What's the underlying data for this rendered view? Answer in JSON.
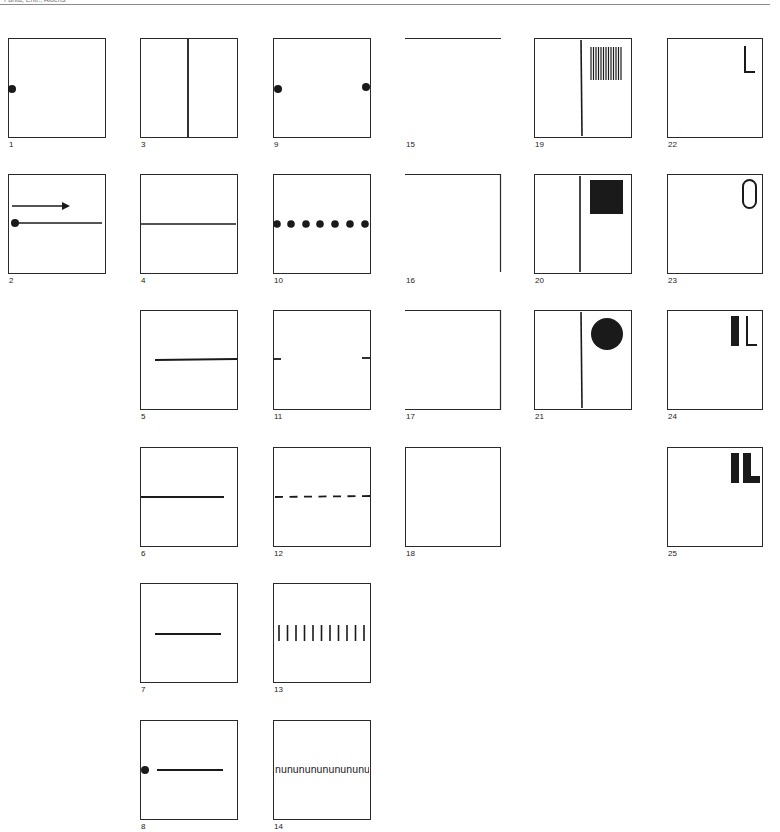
{
  "header": {
    "left_text": "Fanta, Entr., Alberts",
    "center_text": "",
    "right_text": ""
  },
  "figure": {
    "stroke_color": "#1a1a1a",
    "frame_color": "#2a2a2a",
    "panels": [
      {
        "id": "1",
        "label": "1",
        "description": "square frame with dot on left edge at mid-height"
      },
      {
        "id": "2",
        "label": "2",
        "description": "right-pointing arrow above a line starting from a dot at left edge"
      },
      {
        "id": "3",
        "label": "3",
        "description": "square frame divided by vertical center line"
      },
      {
        "id": "4",
        "label": "4",
        "description": "full-width horizontal line at mid-height"
      },
      {
        "id": "5",
        "label": "5",
        "description": "horizontal line from inner left to right edge"
      },
      {
        "id": "6",
        "label": "6",
        "description": "horizontal line from left edge to inner right"
      },
      {
        "id": "7",
        "label": "7",
        "description": "short centered horizontal line"
      },
      {
        "id": "8",
        "label": "8",
        "description": "dot on left edge followed by a detached horizontal line"
      },
      {
        "id": "9",
        "label": "9",
        "description": "dots on left and right edges"
      },
      {
        "id": "10",
        "label": "10",
        "description": "row of seven dots across mid-height"
      },
      {
        "id": "11",
        "label": "11",
        "description": "short ticks at left and right edges"
      },
      {
        "id": "12",
        "label": "12",
        "description": "dashed horizontal line of seven dashes"
      },
      {
        "id": "13",
        "label": "13",
        "description": "row of eleven short vertical bars"
      },
      {
        "id": "14",
        "label": "14",
        "description": "text string across mid-height",
        "text": "nunununununununu"
      },
      {
        "id": "15",
        "label": "15",
        "description": "top edge only"
      },
      {
        "id": "16",
        "label": "16",
        "description": "top and right edges only"
      },
      {
        "id": "17",
        "label": "17",
        "description": "top, right and bottom edges (open left)"
      },
      {
        "id": "18",
        "label": "18",
        "description": "complete square frame, empty"
      },
      {
        "id": "19",
        "label": "19",
        "description": "vertical divider with grating of thin vertical bars at upper right",
        "bar_count": 13
      },
      {
        "id": "20",
        "label": "20",
        "description": "vertical divider with filled black square at upper right"
      },
      {
        "id": "21",
        "label": "21",
        "description": "vertical divider with filled black circle at upper right"
      },
      {
        "id": "22",
        "label": "22",
        "description": "thin letter at upper right",
        "glyph": "L"
      },
      {
        "id": "23",
        "label": "23",
        "description": "thin letter at upper right",
        "glyph": "O"
      },
      {
        "id": "24",
        "label": "24",
        "description": "bold bar plus thin letter at upper right",
        "glyph": "IL"
      },
      {
        "id": "25",
        "label": "25",
        "description": "bold letters at upper right",
        "glyph": "IL"
      }
    ]
  }
}
